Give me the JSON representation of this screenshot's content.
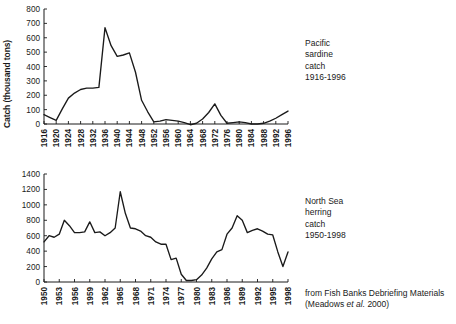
{
  "figure": {
    "background": "#ffffff",
    "ink": "#1a1a1a",
    "source_note_line1": "from Fish Banks Debriefing Materials",
    "source_note_pre": "(Meadows ",
    "source_note_em": "et al.",
    "source_note_post": " 2000)"
  },
  "annotations": {
    "sardine": "Pacific\nsardine\ncatch\n1916-1996",
    "herring": "North Sea\nherring\ncatch\n1950-1998"
  },
  "chart_data": [
    {
      "id": "pacific-sardine",
      "type": "line",
      "title": "Pacific sardine catch 1916-1996",
      "xlabel": "",
      "ylabel": "Catch (thousand tons)",
      "xlim": [
        1916,
        1996
      ],
      "ylim": [
        0,
        800
      ],
      "ytick_values": [
        0,
        100,
        200,
        300,
        400,
        500,
        600,
        700,
        800
      ],
      "ytick_labels": [
        "0",
        "100",
        "200",
        "300",
        "400",
        "500",
        "600",
        "700",
        "800"
      ],
      "xtick_labels": [
        "1916",
        "1920",
        "1924",
        "1928",
        "1932",
        "1936",
        "1940",
        "1944",
        "1948",
        "1952",
        "1956",
        "1960",
        "1964",
        "1968",
        "1972",
        "1976",
        "1980",
        "1984",
        "1988",
        "1992",
        "1996"
      ],
      "xtick_values": [
        1916,
        1920,
        1924,
        1928,
        1932,
        1936,
        1940,
        1944,
        1948,
        1952,
        1956,
        1960,
        1964,
        1968,
        1972,
        1976,
        1980,
        1984,
        1988,
        1992,
        1996
      ],
      "grid": false,
      "legend": "none",
      "series": [
        {
          "name": "Pacific sardine catch",
          "x": [
            1916,
            1918,
            1920,
            1922,
            1924,
            1926,
            1928,
            1930,
            1932,
            1934,
            1936,
            1938,
            1940,
            1942,
            1944,
            1946,
            1948,
            1950,
            1952,
            1954,
            1956,
            1958,
            1960,
            1962,
            1964,
            1966,
            1968,
            1970,
            1972,
            1974,
            1976,
            1978,
            1980,
            1982,
            1984,
            1986,
            1988,
            1990,
            1992,
            1994,
            1996
          ],
          "values": [
            65,
            45,
            25,
            105,
            180,
            215,
            240,
            250,
            250,
            255,
            670,
            545,
            470,
            480,
            495,
            360,
            165,
            85,
            15,
            20,
            30,
            25,
            20,
            10,
            -5,
            5,
            35,
            80,
            140,
            60,
            5,
            10,
            15,
            10,
            0,
            0,
            5,
            20,
            40,
            65,
            90
          ]
        }
      ]
    },
    {
      "id": "north-sea-herring",
      "type": "line",
      "title": "North Sea herring catch 1950-1998",
      "xlabel": "",
      "ylabel": "Landing (thousand tonnes)",
      "xlim": [
        1950,
        1998
      ],
      "ylim": [
        0,
        1400
      ],
      "ytick_values": [
        0,
        200,
        400,
        600,
        800,
        1000,
        1200,
        1400
      ],
      "ytick_labels": [
        "0",
        "200",
        "400",
        "600",
        "800",
        "1000",
        "1200",
        "1400"
      ],
      "xtick_labels": [
        "1950",
        "1953",
        "1956",
        "1959",
        "1962",
        "1965",
        "1968",
        "1971",
        "1974",
        "1977",
        "1980",
        "1983",
        "1986",
        "1989",
        "1992",
        "1995",
        "1998"
      ],
      "xtick_values": [
        1950,
        1953,
        1956,
        1959,
        1962,
        1965,
        1968,
        1971,
        1974,
        1977,
        1980,
        1983,
        1986,
        1989,
        1992,
        1995,
        1998
      ],
      "grid": false,
      "legend": "none",
      "series": [
        {
          "name": "North Sea herring landings",
          "x": [
            1950,
            1951,
            1952,
            1953,
            1954,
            1955,
            1956,
            1957,
            1958,
            1959,
            1960,
            1961,
            1962,
            1963,
            1964,
            1965,
            1966,
            1967,
            1968,
            1969,
            1970,
            1971,
            1972,
            1973,
            1974,
            1975,
            1976,
            1977,
            1978,
            1979,
            1980,
            1981,
            1982,
            1983,
            1984,
            1985,
            1986,
            1987,
            1988,
            1989,
            1990,
            1991,
            1992,
            1993,
            1994,
            1995,
            1996,
            1997,
            1998
          ],
          "values": [
            520,
            600,
            580,
            620,
            800,
            730,
            640,
            640,
            650,
            780,
            640,
            650,
            600,
            640,
            700,
            1170,
            890,
            700,
            690,
            660,
            600,
            580,
            520,
            490,
            490,
            290,
            310,
            100,
            20,
            20,
            30,
            90,
            180,
            300,
            390,
            420,
            620,
            700,
            860,
            800,
            640,
            670,
            690,
            660,
            620,
            610,
            390,
            200,
            390
          ]
        }
      ]
    }
  ]
}
